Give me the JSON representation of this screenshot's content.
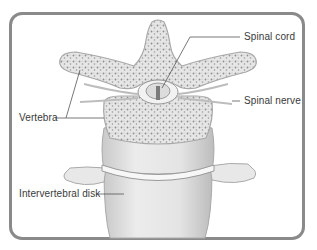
{
  "diagram": {
    "labels": {
      "spinal_cord": "Spinal cord",
      "spinal_nerve": "Spinal nerve",
      "vertebra": "Vertebra",
      "intervertebral_disk": "Intervertebral disk"
    },
    "colors": {
      "frame": "#8a8a8a",
      "bone_fill": "#ececec",
      "bone_stroke": "#a9a9a9",
      "text": "#3a3a3a",
      "leader_line": "#555555"
    }
  }
}
